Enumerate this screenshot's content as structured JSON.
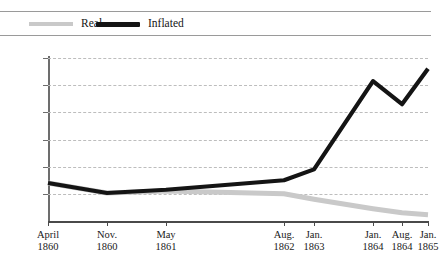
{
  "clipped_header_text": "",
  "legend": {
    "position": "top",
    "entries": [
      {
        "label": "Real",
        "color": "#c9c9c9",
        "icon": "line-swatch-icon"
      },
      {
        "label": "Inflated",
        "color": "#141414",
        "icon": "line-swatch-icon"
      }
    ]
  },
  "chart_data": {
    "type": "line",
    "title": "",
    "subtitle": "",
    "xlabel": "",
    "ylabel": "",
    "grid": true,
    "legend_position": "top",
    "ylim": [
      0,
      6000
    ],
    "ytick_values": [
      1000,
      2000,
      3000,
      4000,
      5000,
      6000
    ],
    "ytick_labels": [
      "$1000",
      "$2000",
      "$3000",
      "$4000",
      "$5000",
      "$6000"
    ],
    "categories": [
      "April 1860",
      "Nov. 1860",
      "May 1861",
      "Aug. 1862",
      "Jan. 1863",
      "Jan. 1864",
      "Aug. 1864",
      "Jan. 1865"
    ],
    "xtick_labels": [
      {
        "month": "April",
        "year": "1860"
      },
      {
        "month": "Nov.",
        "year": "1860"
      },
      {
        "month": "May",
        "year": "1861"
      },
      {
        "month": "Aug.",
        "year": "1862"
      },
      {
        "month": "Jan.",
        "year": "1863"
      },
      {
        "month": "Jan.",
        "year": "1864"
      },
      {
        "month": "Aug.",
        "year": "1864"
      },
      {
        "month": "Jan.",
        "year": "1865"
      }
    ],
    "x_positions_px": [
      0,
      59,
      118,
      236,
      266,
      325,
      354,
      380
    ],
    "series": [
      {
        "name": "Inflated",
        "color": "#141414",
        "width": 4.2,
        "values": [
          1400,
          1030,
          1150,
          1500,
          1900,
          5150,
          4300,
          5600
        ]
      },
      {
        "name": "Real",
        "color": "#c9c9c9",
        "width": 5.0,
        "values": [
          1400,
          1030,
          1100,
          1000,
          800,
          450,
          300,
          230
        ]
      }
    ]
  }
}
